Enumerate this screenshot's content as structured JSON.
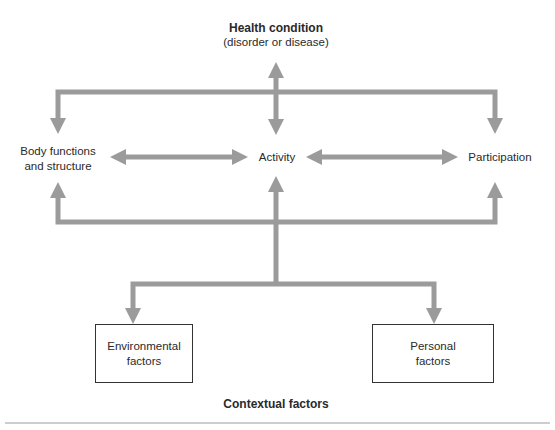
{
  "diagram": {
    "title": "Health condition",
    "subtitle": "(disorder or disease)",
    "nodes": {
      "body": {
        "line1": "Body functions",
        "line2": "and structure"
      },
      "activity": {
        "label": "Activity"
      },
      "participation": {
        "label": "Participation"
      },
      "environmental": {
        "line1": "Environmental",
        "line2": "factors"
      },
      "personal": {
        "line1": "Personal",
        "line2": "factors"
      }
    },
    "footer_label": "Contextual factors",
    "colors": {
      "arrow": "#9b9b9b",
      "box_border": "#333333",
      "text": "#2a2a2a",
      "rule": "#9b9b9b"
    }
  }
}
